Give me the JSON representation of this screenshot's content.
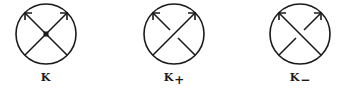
{
  "diagrams": [
    {
      "id": "K",
      "label": "K",
      "subscript": "",
      "crossing": "singular",
      "center_x": 46
    },
    {
      "id": "K_plus",
      "label": "K",
      "subscript": "+",
      "crossing": "positive",
      "center_x": 174
    },
    {
      "id": "K_minus",
      "label": "K",
      "subscript": "−",
      "crossing": "negative",
      "center_x": 300
    }
  ],
  "style": {
    "stroke": "#1a1a1a",
    "background": "#ffffff"
  }
}
